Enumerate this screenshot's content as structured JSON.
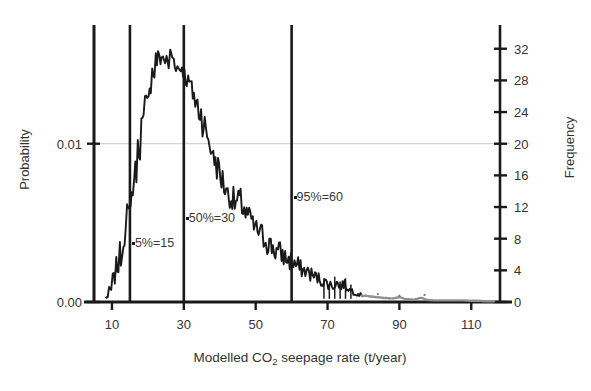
{
  "chart_data": {
    "type": "line",
    "title": "",
    "xlabel": "Modelled CO2 seepage rate (t/year)",
    "xlabel_parts": {
      "pre": "Modelled CO",
      "sub": "2",
      "post": " seepage rate (t/year)"
    },
    "ylabel": "Probability",
    "ylabel_right": "Frequency",
    "xlim": [
      5,
      118
    ],
    "ylim": [
      0,
      0.0175
    ],
    "ylim_right": [
      0,
      35
    ],
    "xticks": [
      10,
      30,
      50,
      70,
      90,
      110
    ],
    "xtick_labels": [
      "10",
      "30",
      "50",
      "70",
      "90",
      "110"
    ],
    "yticks_left": [
      0.0,
      0.01
    ],
    "ytick_labels_left": [
      "0.00",
      "0.01"
    ],
    "yticks_right": [
      0,
      4,
      8,
      12,
      16,
      20,
      24,
      28,
      32
    ],
    "ytick_labels_right": [
      "0",
      "4",
      "8",
      "12",
      "16",
      "20",
      "24",
      "28",
      "32"
    ],
    "grid": "single horizontal gridline at y=0.01 / frequency 20",
    "gridline_value": 0.01,
    "legend": "none",
    "series_name": "Modelled CO2 seepage rate distribution",
    "line_color": "#1a1a1a",
    "tail_color": "#8f8f8f",
    "gridline_color": "#c8c8c8",
    "annotations": [
      {
        "name": "p05",
        "label": "5%=15",
        "x": 15,
        "percentile": 5
      },
      {
        "name": "p50",
        "label": "50%=30",
        "x": 30,
        "percentile": 50
      },
      {
        "name": "p95",
        "label": "95%=60",
        "x": 60,
        "percentile": 95
      }
    ],
    "vertical_lines": [
      5,
      15,
      30,
      60
    ],
    "x": [
      8.5,
      9.5,
      10.5,
      11.5,
      12.5,
      13.5,
      14.5,
      15.5,
      16.5,
      17.5,
      18.5,
      19.5,
      20.5,
      21.5,
      22.5,
      23.5,
      24.5,
      25.5,
      26.5,
      27.5,
      28.5,
      29.5,
      30.5,
      31.5,
      32.5,
      33.5,
      34.5,
      35.5,
      36.5,
      37.5,
      38.5,
      39.5,
      40.5,
      41.5,
      42.5,
      43.5,
      44.5,
      45.5,
      46.5,
      47.5,
      48.5,
      49.5,
      50.5,
      51.5,
      52.5,
      53.5,
      54.5,
      55.5,
      56.5,
      57.5,
      58.5,
      59.5,
      60.5,
      61.5,
      62.5,
      63.5,
      64.5,
      65.5,
      66.5,
      67.5,
      68.5,
      69.5,
      70.5,
      71.5,
      72.5,
      73.5,
      74.5,
      75.5,
      76.5,
      77.5,
      78.5,
      79.5,
      80.5,
      82,
      84,
      86,
      88,
      90,
      92,
      94,
      96,
      98,
      100,
      102,
      104,
      106,
      108,
      110,
      112,
      114,
      116
    ],
    "frequency": [
      0.6,
      1.5,
      3.0,
      4.5,
      6.0,
      8.5,
      11.0,
      13.5,
      16.5,
      19.5,
      22.5,
      25.0,
      27.5,
      29.0,
      30.5,
      31.0,
      30.8,
      30.0,
      31.2,
      30.5,
      29.5,
      29.8,
      28.5,
      27.5,
      26.5,
      25.0,
      24.0,
      22.5,
      21.0,
      19.5,
      18.0,
      17.0,
      15.5,
      14.5,
      13.5,
      13.0,
      12.5,
      12.8,
      12.0,
      11.0,
      10.5,
      9.5,
      9.0,
      8.5,
      8.0,
      7.5,
      7.0,
      6.5,
      6.2,
      6.0,
      5.5,
      5.2,
      5.0,
      4.6,
      4.2,
      4.0,
      3.8,
      3.5,
      3.2,
      3.0,
      2.6,
      2.5,
      2.2,
      2.0,
      2.4,
      2.0,
      2.2,
      1.8,
      1.5,
      1.2,
      1.0,
      0.9,
      0.8,
      0.7,
      0.6,
      0.5,
      0.45,
      0.6,
      0.35,
      0.3,
      0.5,
      0.25,
      0.2,
      0.2,
      0.2,
      0.2,
      0.2,
      0.15,
      0.15,
      0.1,
      0.1
    ],
    "noise_amplitude": 1.6,
    "tail_start_x": 80
  },
  "figure": {
    "background": "#ffffff",
    "axis_color": "#1a1a1a",
    "width": 591,
    "height": 391
  }
}
